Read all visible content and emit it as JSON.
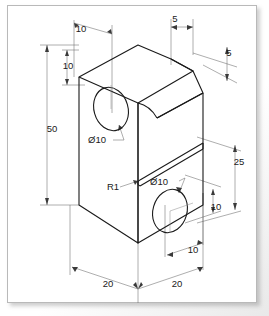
{
  "drawing": {
    "type": "isometric-engineering-drawing",
    "title": "Isometric part drawing",
    "description": "Rectangular prism with chamfered top corner, two through holes and a horizontal groove",
    "units": "mm",
    "colors": {
      "line": "#1a1a1a",
      "dimension_line": "#5a5a5a",
      "background": "#ffffff",
      "frame": "#b9b9b9"
    },
    "dimensions": [
      {
        "id": "top-width-10",
        "label": "10",
        "placement": "top-left",
        "x": 74,
        "y": 27
      },
      {
        "id": "top-depth-5",
        "label": "5",
        "placement": "top-right",
        "x": 168,
        "y": 17
      },
      {
        "id": "chamfer-5",
        "label": "5",
        "placement": "right-upper",
        "x": 222,
        "y": 51
      },
      {
        "id": "hole-height-10",
        "label": "10",
        "placement": "left-upper",
        "x": 61,
        "y": 64
      },
      {
        "id": "total-height-50",
        "label": "50",
        "placement": "left",
        "x": 45,
        "y": 127
      },
      {
        "id": "upper-hole-dia",
        "label": "Ø10",
        "placement": "upper-hole-leader",
        "x": 90,
        "y": 138
      },
      {
        "id": "fillet-r1",
        "label": "R1",
        "placement": "groove-leader",
        "x": 106,
        "y": 185
      },
      {
        "id": "lower-hole-dia",
        "label": "Ø10",
        "placement": "lower-hole-leader",
        "x": 152,
        "y": 180
      },
      {
        "id": "groove-height-25",
        "label": "25",
        "placement": "right",
        "x": 232,
        "y": 160
      },
      {
        "id": "lower-hole-height-10",
        "label": "10",
        "placement": "right-lower",
        "x": 209,
        "y": 205
      },
      {
        "id": "lower-hole-offset-10",
        "label": "10",
        "placement": "bottom-right",
        "x": 186,
        "y": 248
      },
      {
        "id": "base-width-left-20",
        "label": "20",
        "placement": "bottom-left",
        "x": 101,
        "y": 282
      },
      {
        "id": "base-width-right-20",
        "label": "20",
        "placement": "bottom-right",
        "x": 170,
        "y": 282
      }
    ]
  }
}
